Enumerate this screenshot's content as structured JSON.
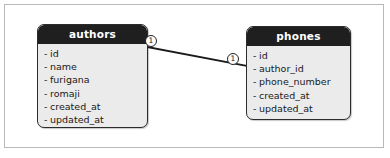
{
  "diagram": {
    "type": "entity-relationship-diagram",
    "background_color": "#ffffff",
    "frame_color": "#b8b8bc",
    "entities": [
      {
        "name": "authors",
        "header_bg": "#1f1f1f",
        "header_fg": "#ffffff",
        "body_bg": "#ebebeb",
        "fields": [
          {
            "bullet": "-",
            "label": "id"
          },
          {
            "bullet": "-",
            "label": "name"
          },
          {
            "bullet": "-",
            "label": "furigana"
          },
          {
            "bullet": "-",
            "label": "romaji"
          },
          {
            "bullet": "-",
            "label": "created_at"
          },
          {
            "bullet": "-",
            "label": "updated_at"
          }
        ]
      },
      {
        "name": "phones",
        "header_bg": "#1f1f1f",
        "header_fg": "#ffffff",
        "body_bg": "#ebebeb",
        "fields": [
          {
            "bullet": "-",
            "label": "id"
          },
          {
            "bullet": "-",
            "label": "author_id"
          },
          {
            "bullet": "-",
            "label": "phone_number"
          },
          {
            "bullet": "-",
            "label": "created_at"
          },
          {
            "bullet": "-",
            "label": "updated_at"
          }
        ]
      }
    ],
    "relationship": {
      "from_entity": "authors",
      "to_entity": "phones",
      "line_color": "#1a1a1a",
      "cardinality_from": "1",
      "cardinality_to": "1"
    }
  }
}
